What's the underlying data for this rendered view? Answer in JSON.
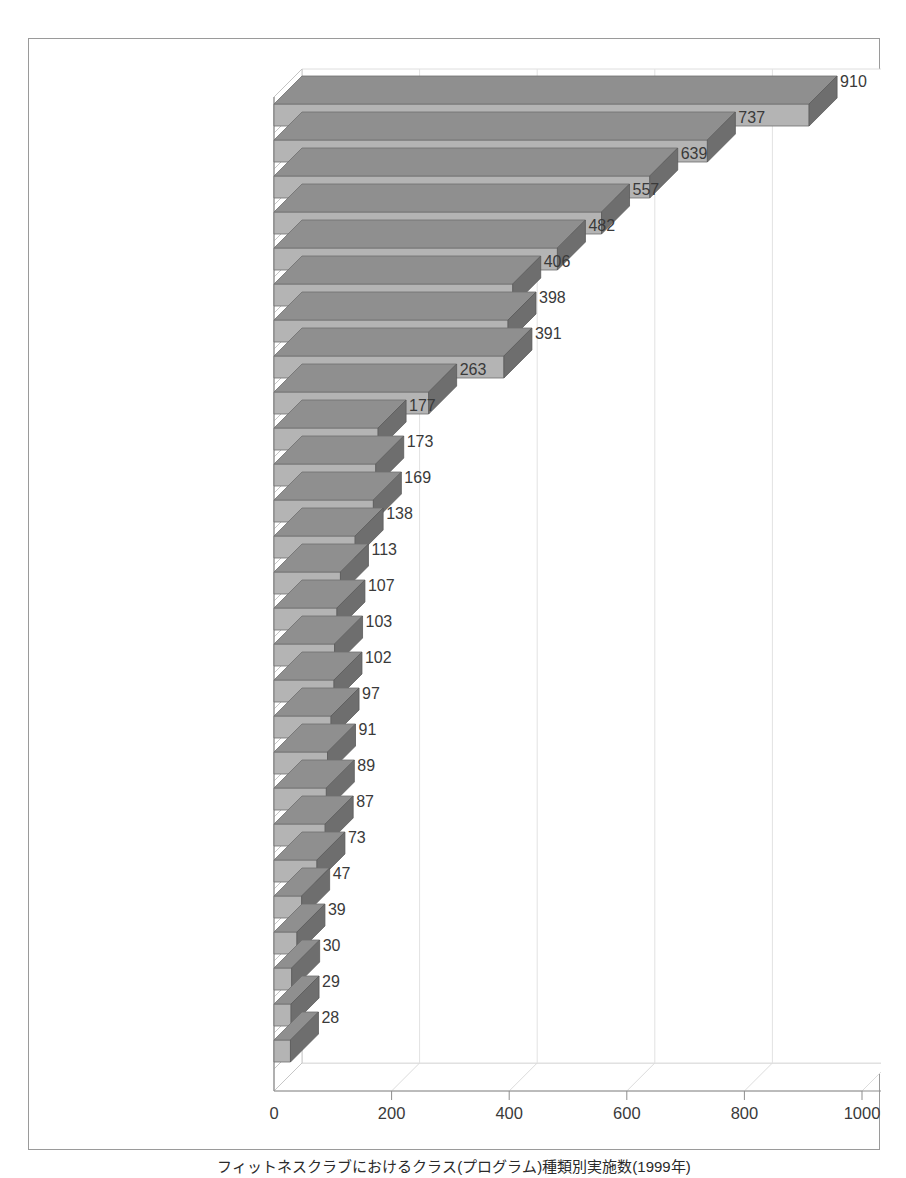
{
  "caption": {
    "text": "フィットネスクラブにおけるクラス(プログラム)種類別実施数(1999年)"
  },
  "chart_data": {
    "type": "bar",
    "orientation": "horizontal",
    "style": "3d",
    "title": "",
    "subtitle": "",
    "xlabel": "",
    "ylabel": "",
    "xlim": [
      0,
      1000
    ],
    "xticks": [
      0,
      200,
      400,
      600,
      800,
      1000
    ],
    "xtick_labels": [
      "0",
      "200",
      "400",
      "600",
      "800",
      "1000"
    ],
    "grid": true,
    "grid_axis": "x",
    "legend": false,
    "legend_position": "none",
    "bar_color_front": "#b4b4b4",
    "bar_color_top": "#8f8f8f",
    "bar_color_side": "#6e6e6e",
    "categories": [
      "アクア",
      "ステップ",
      "エアロ",
      "ファンク・ヒップホップ",
      "ヨガ",
      "シェイプアップ系",
      "ジャズダンス系",
      "中高年向け",
      "ジュニア",
      "太極拳",
      "スイム",
      "気功",
      "ストレッチ",
      "バイオメトリクス",
      "バレエ",
      "武道・格闘系",
      "肩凝り・腰痛解消",
      "ジャザサイズ",
      "健美操",
      "筋コンディショニング",
      "マタニティ系",
      "競技",
      "スライド",
      "健康体操",
      "サーキット",
      "バイクエクササイズ",
      "リラクゼーション系"
    ],
    "values": [
      910,
      737,
      639,
      557,
      482,
      406,
      398,
      391,
      263,
      177,
      173,
      169,
      138,
      113,
      107,
      103,
      102,
      97,
      91,
      89,
      87,
      73,
      47,
      39,
      30,
      29,
      28
    ],
    "value_labels": [
      "910",
      "737",
      "639",
      "557",
      "482",
      "406",
      "398",
      "391",
      "263",
      "177",
      "173",
      "169",
      "138",
      "113",
      "107",
      "103",
      "102",
      "97",
      "91",
      "89",
      "87",
      "73",
      "47",
      "39",
      "30",
      "29",
      "28"
    ]
  }
}
